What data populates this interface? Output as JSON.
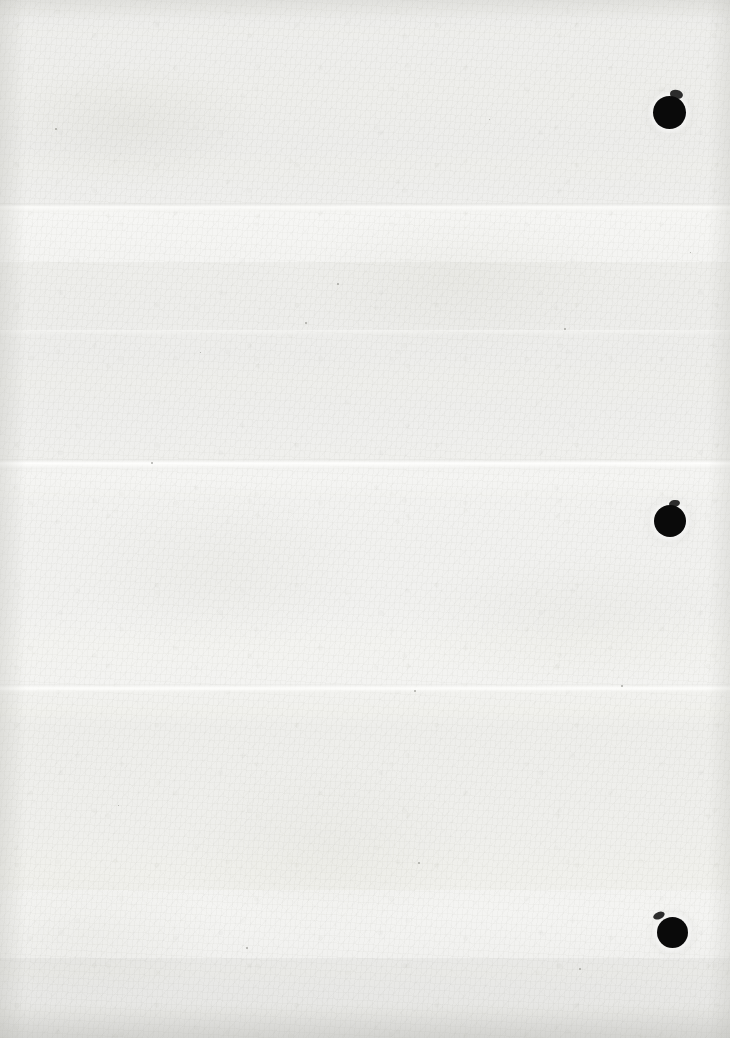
{
  "document": {
    "kind": "scanned-blank-sheet",
    "title": "Blank scanned page",
    "width": 730,
    "height": 1038,
    "visible_text": "",
    "content_note": "No printed or handwritten text is visible on this page."
  },
  "paper": {
    "base_color": "#f4f4f2",
    "highlight_color": "#f9f9f7",
    "shadow_color": "#e4e4e0",
    "edge_shadow_color": "#bab9b4"
  },
  "punch_holes": {
    "count": 3,
    "color": "#0a0a0a",
    "items": [
      {
        "label": "top-punch-hole",
        "cx": 669,
        "cy": 112,
        "d": 33
      },
      {
        "label": "middle-punch-hole",
        "cx": 670,
        "cy": 521,
        "d": 32
      },
      {
        "label": "bottom-punch-hole",
        "cx": 672,
        "cy": 932,
        "d": 31
      }
    ]
  },
  "creases": {
    "count": 4,
    "items": [
      {
        "label": "crease-upper",
        "y": 207
      },
      {
        "label": "crease-middle",
        "y": 463
      },
      {
        "label": "crease-lower",
        "y": 688
      },
      {
        "label": "crease-faint",
        "y": 332
      }
    ]
  },
  "specks": [
    {
      "x": 55,
      "y": 128,
      "s": 2
    },
    {
      "x": 151,
      "y": 462,
      "s": 2
    },
    {
      "x": 305,
      "y": 322,
      "s": 2
    },
    {
      "x": 337,
      "y": 283,
      "s": 2
    },
    {
      "x": 414,
      "y": 690,
      "s": 2
    },
    {
      "x": 418,
      "y": 862,
      "s": 2
    },
    {
      "x": 246,
      "y": 947,
      "s": 2
    },
    {
      "x": 564,
      "y": 328,
      "s": 2
    },
    {
      "x": 621,
      "y": 685,
      "s": 2
    },
    {
      "x": 579,
      "y": 968,
      "s": 2
    },
    {
      "x": 200,
      "y": 352,
      "s": 1
    },
    {
      "x": 489,
      "y": 119,
      "s": 1
    },
    {
      "x": 690,
      "y": 252,
      "s": 1
    },
    {
      "x": 118,
      "y": 805,
      "s": 1
    }
  ]
}
